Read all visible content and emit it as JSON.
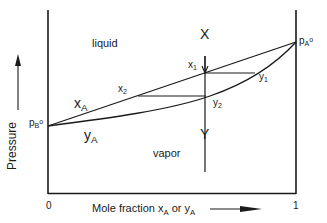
{
  "diagram": {
    "type": "phase-diagram",
    "title": "",
    "axes": {
      "y_label": "Pressure",
      "x_label_prefix": "Mole fraction ",
      "x_label_x": "x",
      "x_label_x_sub": "A",
      "x_label_or": " or ",
      "x_label_y": "y",
      "x_label_y_sub": "A",
      "x_tick_0": "0",
      "x_tick_1": "1"
    },
    "regions": {
      "liquid": "liquid",
      "vapor": "vapor"
    },
    "curves": {
      "liquid_line": {
        "label": "x",
        "sub": "A"
      },
      "vapor_line": {
        "label": "y",
        "sub": "A"
      }
    },
    "endpoints": {
      "pB": {
        "p": "p",
        "sub": "B",
        "sup": "o"
      },
      "pA": {
        "p": "p",
        "sub": "A",
        "sup": "o"
      }
    },
    "points": {
      "x1": {
        "label": "x",
        "sub": "1"
      },
      "x2": {
        "label": "x",
        "sub": "2"
      },
      "y1": {
        "label": "y",
        "sub": "1"
      },
      "y2": {
        "label": "y",
        "sub": "2"
      }
    },
    "vertical_line": {
      "top_label": "X",
      "bottom_label": "Y"
    },
    "colors": {
      "line": "#1a1a1a",
      "background": "#ffffff"
    }
  }
}
